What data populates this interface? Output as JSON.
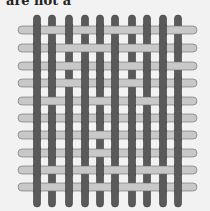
{
  "caption": "are not a",
  "figure": {
    "warp_color": "#5a5a5a",
    "warp_edge": "#3a3a3a",
    "weft_color": "#c8c8c8",
    "weft_edge": "#6a6a6a",
    "background": "#f2f2f2",
    "warp_x": [
      37,
      52,
      69,
      85,
      100,
      115,
      132,
      147,
      163,
      178
    ],
    "weft_y": [
      30,
      48,
      66,
      83,
      101,
      118,
      135,
      153,
      170,
      187
    ],
    "warp_top": 15,
    "warp_bottom": 207,
    "weft_left": 18,
    "weft_right": 197,
    "warp_width": 7,
    "weft_height": 8,
    "weave": [
      [
        1,
        0,
        1,
        0,
        1,
        0,
        0,
        1,
        1,
        0
      ],
      [
        1,
        1,
        0,
        0,
        0,
        1,
        0,
        0,
        1,
        1
      ],
      [
        1,
        1,
        0,
        1,
        1,
        1,
        0,
        1,
        1,
        0
      ],
      [
        1,
        1,
        0,
        1,
        1,
        1,
        0,
        1,
        1,
        1
      ],
      [
        1,
        0,
        1,
        1,
        0,
        1,
        1,
        0,
        1,
        1
      ],
      [
        1,
        1,
        1,
        1,
        1,
        1,
        1,
        1,
        1,
        1
      ],
      [
        1,
        1,
        1,
        1,
        0,
        1,
        1,
        1,
        1,
        1
      ],
      [
        1,
        1,
        1,
        1,
        0,
        1,
        1,
        1,
        1,
        1
      ],
      [
        1,
        0,
        1,
        0,
        1,
        0,
        1,
        0,
        0,
        1
      ],
      [
        1,
        0,
        1,
        1,
        0,
        1,
        0,
        0,
        1,
        1
      ]
    ]
  }
}
